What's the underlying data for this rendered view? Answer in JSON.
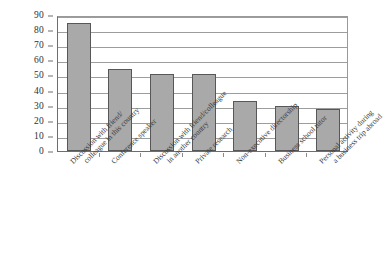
{
  "chart_data": {
    "type": "bar",
    "title": "",
    "subtitle": "",
    "xlabel": "",
    "ylabel": "",
    "ylim": [
      0,
      90
    ],
    "ytick_step": 10,
    "yticks": [
      "90",
      "80",
      "70",
      "60",
      "50",
      "40",
      "30",
      "20",
      "10",
      "0"
    ],
    "grid": true,
    "legend": false,
    "legend_position": "none",
    "categories": [
      "Discussion with friend/ colleague in this country",
      "Conference speaker",
      "Discussion with friend/colleague in another country",
      "Private research",
      "Non-executive directorship",
      "Business school tutor",
      "Personal activity during a business trip abroad"
    ],
    "category_lines": [
      [
        "Discussion with friend/",
        "colleague in this country"
      ],
      [
        "Conference speaker",
        ""
      ],
      [
        "Discussion with friend/colleague",
        "in another country"
      ],
      [
        "Private research",
        ""
      ],
      [
        "Non-executive directorship",
        ""
      ],
      [
        "Business school tutor",
        ""
      ],
      [
        "Personal activity during",
        "a business trip abroad"
      ]
    ],
    "values": [
      85,
      54,
      51,
      51,
      33,
      30,
      28
    ],
    "bar_color": "#a9a9a9",
    "bar_edge_color": "#575757",
    "grid_color": "#9d9d9d",
    "axis_color": "#6e6e6e",
    "background_color": "#ffffff"
  }
}
